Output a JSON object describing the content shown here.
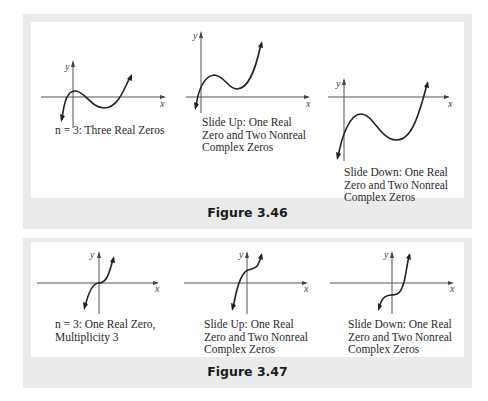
{
  "figures": [
    {
      "title": "Figure 3.46",
      "graphs": [
        {
          "caption": "n = 3: Three Real Zeros",
          "x_label": "x",
          "y_label": "y",
          "shape": "cubic-three-real-zeros"
        },
        {
          "caption": "Slide Up: One Real\nZero and Two Nonreal\nComplex Zeros",
          "x_label": "x",
          "y_label": "y",
          "shape": "cubic-shifted-up"
        },
        {
          "caption": "Slide Down: One Real\nZero and Two Nonreal\nComplex Zeros",
          "x_label": "x",
          "y_label": "y",
          "shape": "cubic-shifted-down"
        }
      ]
    },
    {
      "title": "Figure 3.47",
      "graphs": [
        {
          "caption": "n = 3: One Real Zero,\nMultiplicity 3",
          "x_label": "x",
          "y_label": "y",
          "shape": "cubic-triple-root"
        },
        {
          "caption": "Slide Up: One Real\nZero and Two Nonreal\nComplex Zeros",
          "x_label": "x",
          "y_label": "y",
          "shape": "triple-root-shifted-up"
        },
        {
          "caption": "Slide Down: One Real\nZero and Two Nonreal\nComplex Zeros",
          "x_label": "x",
          "y_label": "y",
          "shape": "triple-root-shifted-down"
        }
      ]
    }
  ],
  "colors": {
    "panel_gray": "#ebebeb",
    "curve": "#222222",
    "axis": "#555555"
  }
}
